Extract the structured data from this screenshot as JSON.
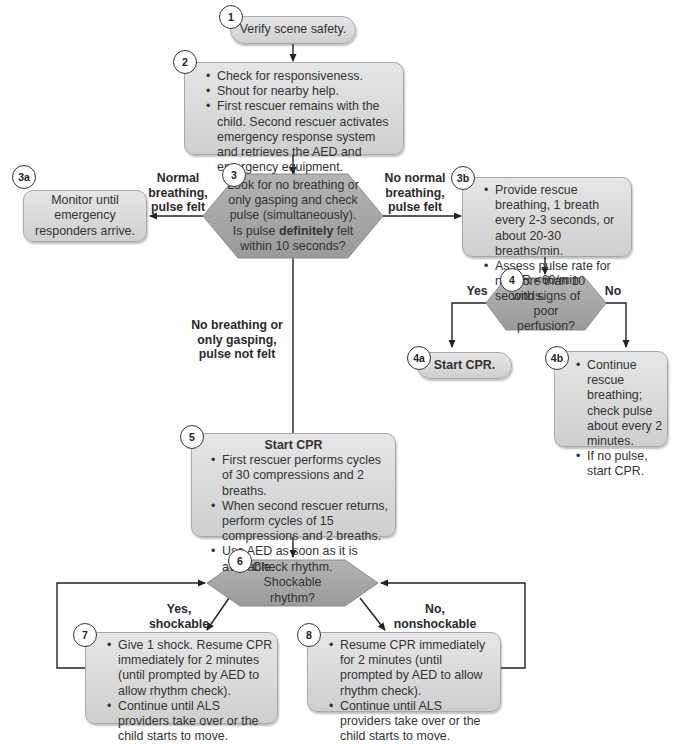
{
  "flowchart": {
    "colors": {
      "box_fill_top": "#e6e6e6",
      "box_fill_bottom": "#cfcfcf",
      "decision_fill": "#a9a9a9",
      "line": "#222222"
    },
    "step1": {
      "badge": "1",
      "text": "Verify scene safety."
    },
    "step2": {
      "badge": "2",
      "items": [
        "Check for responsiveness.",
        "Shout for nearby help.",
        "First rescuer remains with the child. Second rescuer activates emergency response system and retrieves the AED and emergency equipment."
      ]
    },
    "step3": {
      "badge": "3",
      "text_before": "Look for no breathing or only gasping and check pulse (simultaneously). Is pulse ",
      "text_bold": "definitely",
      "text_after": " felt within 10 seconds?"
    },
    "step3a": {
      "badge": "3a",
      "text": "Monitor until emergency responders arrive."
    },
    "step3b": {
      "badge": "3b",
      "items": [
        "Provide rescue breathing, 1 breath every 2-3 seconds, or about 20-30 breaths/min.",
        "Assess pulse rate for no more than 10 seconds."
      ]
    },
    "step4": {
      "badge": "4",
      "text": "HR <60/min with signs of poor perfusion?"
    },
    "step4a": {
      "badge": "4a",
      "text": "Start CPR."
    },
    "step4b": {
      "badge": "4b",
      "items": [
        "Continue rescue breathing; check pulse about every 2 minutes.",
        "If no pulse, start CPR."
      ]
    },
    "step5": {
      "badge": "5",
      "title": "Start CPR",
      "items": [
        "First rescuer performs cycles of 30 compressions and 2 breaths.",
        "When second rescuer returns, perform cycles of 15 compressions and 2 breaths.",
        "Use AED as soon as it is available."
      ]
    },
    "step6": {
      "badge": "6",
      "text": "Check rhythm. Shockable rhythm?"
    },
    "step7": {
      "badge": "7",
      "items": [
        "Give 1 shock. Resume CPR immediately for 2 minutes (until prompted by AED to allow rhythm check).",
        "Continue until ALS providers take over or the child starts to move."
      ]
    },
    "step8": {
      "badge": "8",
      "items": [
        "Resume CPR immediately for 2 minutes (until prompted by AED to allow rhythm check).",
        "Continue until ALS providers take over or the child starts to move."
      ]
    },
    "edge_labels": {
      "normal_breathing": "Normal breathing, pulse felt",
      "no_normal_breathing": "No normal breathing, pulse felt",
      "no_breathing": "No breathing or only gasping, pulse not felt",
      "yes": "Yes",
      "no": "No",
      "shockable": "Yes, shockable",
      "nonshockable": "No, nonshockable"
    }
  }
}
